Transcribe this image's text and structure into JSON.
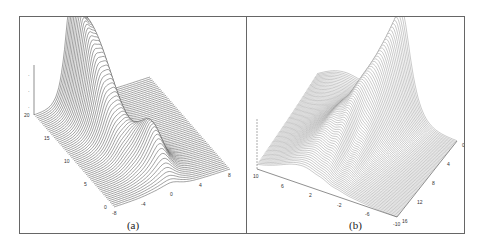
{
  "figure": {
    "panels": [
      {
        "id": "a",
        "caption": "(a)"
      },
      {
        "id": "b",
        "caption": "(b)"
      }
    ]
  },
  "chart_data": [
    {
      "type": "surface",
      "panel": "(a)",
      "title": "",
      "description": "3D wireframe surface: two sharp peaks merging near x≈-2 at large t, with a third ridge near x≈0 at small t; flat plane elsewhere",
      "x_axis": {
        "label": "",
        "ticks": [
          "-8",
          "-4",
          "0",
          "4",
          "8"
        ],
        "range": [
          -8,
          8
        ]
      },
      "y_axis": {
        "label": "",
        "ticks": [
          "0",
          "5",
          "10",
          "15",
          "20"
        ],
        "range": [
          0,
          20
        ]
      },
      "z_axis": {
        "label": "",
        "ticks": [
          "",
          "",
          ""
        ]
      },
      "surface_color": "#555555",
      "peaks": [
        {
          "x": -3,
          "t": 20,
          "relative_height": 1.0
        },
        {
          "x": -1.5,
          "t": 18,
          "relative_height": 0.75
        },
        {
          "x": 0,
          "t": 5,
          "relative_height": 0.45
        }
      ]
    },
    {
      "type": "surface",
      "panel": "(b)",
      "title": "",
      "description": "3D mesh surface: single dominant ridge peaking near x≈-2, t≈0, with oscillatory ripples near x≈2 to -2 and broad sloping wing",
      "x_axis": {
        "label": "",
        "ticks": [
          "10",
          "6",
          "2",
          "-2",
          "-6",
          "-10"
        ],
        "range": [
          10,
          -10
        ]
      },
      "y_axis": {
        "label": "",
        "ticks": [
          "0",
          "4",
          "8",
          "12",
          "16"
        ],
        "range": [
          0,
          16
        ]
      },
      "z_axis": {
        "label": "",
        "ticks": [
          "",
          "",
          ""
        ]
      },
      "surface_color": "#888888",
      "peaks": [
        {
          "x": -2,
          "t": 0,
          "relative_height": 1.0
        }
      ]
    }
  ]
}
